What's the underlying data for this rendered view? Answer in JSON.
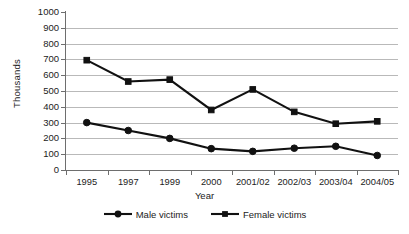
{
  "chart_data": {
    "type": "line",
    "title": "",
    "xlabel": "Year",
    "ylabel": "Thousands",
    "categories": [
      "1995",
      "1997",
      "1999",
      "2000",
      "2001/02",
      "2002/03",
      "2003/04",
      "2004/05"
    ],
    "series": [
      {
        "name": "Male victims",
        "marker": "circle",
        "color": "#111111",
        "values": [
          300,
          250,
          200,
          135,
          118,
          138,
          150,
          92
        ]
      },
      {
        "name": "Female victims",
        "marker": "square",
        "color": "#111111",
        "values": [
          695,
          560,
          572,
          380,
          510,
          368,
          293,
          308
        ]
      }
    ],
    "ylim": [
      0,
      1000
    ],
    "ytick_values": [
      0,
      100,
      200,
      300,
      400,
      500,
      600,
      700,
      800,
      900,
      1000
    ],
    "ytick_labels": [
      "0",
      "100",
      "200",
      "300",
      "400",
      "500",
      "600",
      "700",
      "800",
      "900",
      "1000"
    ],
    "grid": "horizontal",
    "gridline_color": "#b9b9b9",
    "axis_color": "#6e6e6e",
    "legend_position": "bottom-center",
    "legend_entries": [
      "Male victims",
      "Female victims"
    ],
    "background": "#ffffff"
  }
}
